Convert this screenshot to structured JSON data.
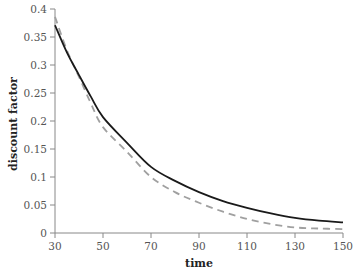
{
  "chart_data": {
    "type": "line",
    "title": "",
    "xlabel": "time",
    "ylabel": "discount factor",
    "xlim": [
      30,
      150
    ],
    "ylim": [
      0,
      0.4
    ],
    "xticks": [
      30,
      50,
      70,
      90,
      110,
      130,
      150
    ],
    "xtick_labels": [
      "30",
      "50",
      "70",
      "90",
      "110",
      "130",
      "150"
    ],
    "yticks": [
      0,
      0.05,
      0.1,
      0.15,
      0.2,
      0.25,
      0.3,
      0.35,
      0.4
    ],
    "ytick_labels": [
      "0",
      "0.05",
      "0.1",
      "0.15",
      "0.2",
      "0.25",
      "0.3",
      "0.35",
      "0.4"
    ],
    "grid": false,
    "legend": null,
    "x": [
      30,
      35,
      40,
      45,
      50,
      60,
      70,
      80,
      90,
      100,
      110,
      120,
      130,
      140,
      150
    ],
    "series": [
      {
        "name": "solid",
        "style": "solid",
        "color": "#1a1a1a",
        "values": [
          0.371,
          0.322,
          0.282,
          0.243,
          0.207,
          0.161,
          0.118,
          0.093,
          0.073,
          0.057,
          0.045,
          0.035,
          0.027,
          0.022,
          0.019
        ]
      },
      {
        "name": "dashed",
        "style": "dashed",
        "color": "#a0a0a0",
        "values": [
          0.386,
          0.326,
          0.279,
          0.231,
          0.189,
          0.145,
          0.1,
          0.073,
          0.054,
          0.038,
          0.025,
          0.016,
          0.01,
          0.008,
          0.007
        ]
      }
    ]
  }
}
